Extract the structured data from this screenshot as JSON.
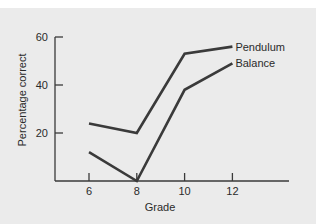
{
  "chart_data": {
    "type": "line",
    "title": "",
    "xlabel": "Grade",
    "ylabel": "Percentage correct",
    "x": [
      6,
      8,
      10,
      12
    ],
    "x_tick_labels": [
      "6",
      "8",
      "10",
      "12"
    ],
    "y_tick_labels": [
      "20",
      "40",
      "60"
    ],
    "y_ticks": [
      20,
      40,
      60
    ],
    "ylim": [
      0,
      60
    ],
    "xlim": [
      4.5,
      16
    ],
    "grid": false,
    "legend": "inline labels at line ends",
    "series": [
      {
        "name": "Pendulum",
        "values": [
          24,
          20,
          53,
          56
        ]
      },
      {
        "name": "Balance",
        "values": [
          12,
          0,
          38,
          49
        ]
      }
    ]
  },
  "colors": {
    "background": "#ebebeb",
    "top_strip": "#ffffff",
    "line": "#3a3a3a",
    "axis": "#3a3a3a",
    "text": "#2a2a2a"
  }
}
